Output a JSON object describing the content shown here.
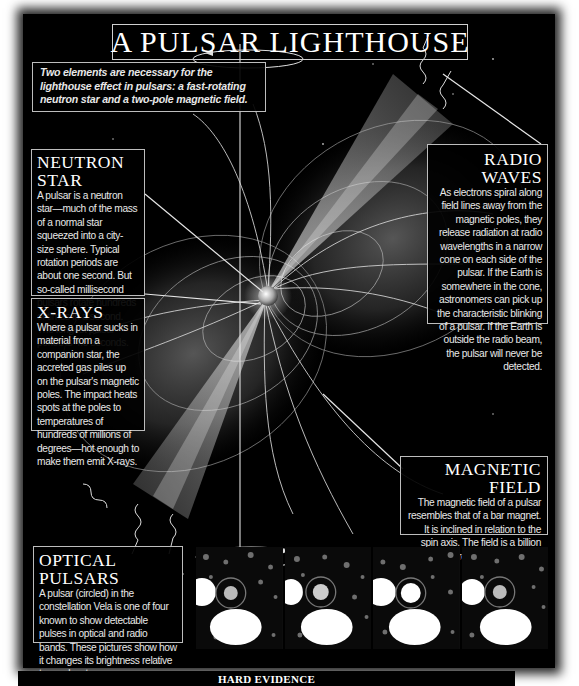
{
  "title": "A PULSAR LIGHTHOUSE",
  "intro": "Two elements are necessary for the lighthouse effect in pulsars: a fast-rotating neutron star and a two-pole magnetic field.",
  "sections": {
    "neutron_star": {
      "heading": "NEUTRON STAR",
      "body": "A pulsar is a neutron star—much of the mass of a normal star squeezed into a city-size sphere. Typical rotation periods are about one second. But so-called millisecond pulsars rotate hundreds of times in a second. The longest pulsar period is 4.3 seconds."
    },
    "x_rays": {
      "heading": "X-RAYS",
      "body": "Where a pulsar sucks in material from a companion star, the accreted gas piles up on the pulsar's magnetic poles. The impact heats spots at the poles to temperatures of hundreds of millions of degrees—hot enough to make them emit X-rays."
    },
    "radio_waves": {
      "heading": "RADIO WAVES",
      "body": "As electrons spiral along field lines away from the magnetic poles, they release radiation at radio wavelengths in a narrow cone on each side of the pulsar. If the Earth is somewhere in the cone, astronomers can pick up the characteristic blinking of a pulsar. If the Earth is outside the radio beam, the pulsar will never be detected."
    },
    "magnetic_field": {
      "heading": "MAGNETIC FIELD",
      "body": "The magnetic field of a pulsar resembles that of a bar magnet. It is inclined in relation to the spin axis. The field is a billion times stronger than fields of normal stars."
    },
    "optical_pulsars": {
      "heading": "OPTICAL PULSARS",
      "body": "A pulsar (circled) in the constellation Vela is one of four known to show detectable pulses in optical and radio bands. These pictures show how it changes its brightness relative to nearby stars."
    }
  },
  "photos": [
    {
      "label": "Vela pulsar frame 1",
      "pulsar_brightness": 0.55
    },
    {
      "label": "Vela pulsar frame 2",
      "pulsar_brightness": 0.65
    },
    {
      "label": "Vela pulsar frame 3",
      "pulsar_brightness": 1.0
    },
    {
      "label": "Vela pulsar frame 4",
      "pulsar_brightness": 0.6
    }
  ],
  "footer": "HARD EVIDENCE",
  "colors": {
    "background": "#000000",
    "text": "#ffffff",
    "line": "#d8d8d8",
    "page": "#ffffff"
  }
}
